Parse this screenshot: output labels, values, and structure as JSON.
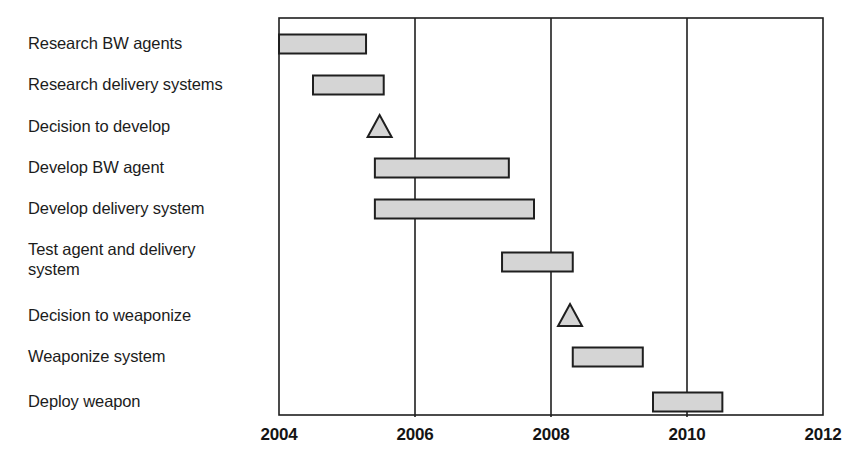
{
  "chart_data": {
    "type": "bar",
    "chart_subtype": "gantt",
    "title": "",
    "xlabel": "",
    "ylabel": "",
    "xlim": [
      2004,
      2012
    ],
    "xticks": [
      2004,
      2006,
      2008,
      2010,
      2012
    ],
    "xtick_labels": [
      "2004",
      "2006",
      "2008",
      "2010",
      "2012"
    ],
    "gridlines": [
      2006,
      2008,
      2010
    ],
    "grid": true,
    "legend": "none",
    "bar_fill": "#d5d5d5",
    "bar_stroke": "#1f1f1f",
    "axis_color": "#1f1f1f",
    "categories": [
      "Research BW agents",
      "Research delivery systems",
      "Decision to develop",
      "Develop BW agent",
      "Develop delivery system",
      "Test agent and delivery\nsystem",
      "Decision to weaponize",
      "Weaponize system",
      "Deploy weapon"
    ],
    "tasks": [
      {
        "name": "Research BW agents",
        "marker": "bar",
        "start": 2004.0,
        "end": 2005.28
      },
      {
        "name": "Research delivery systems",
        "marker": "bar",
        "start": 2004.5,
        "end": 2005.54
      },
      {
        "name": "Decision to develop",
        "marker": "milestone",
        "at": 2005.48
      },
      {
        "name": "Develop BW agent",
        "marker": "bar",
        "start": 2005.41,
        "end": 2007.38
      },
      {
        "name": "Develop delivery system",
        "marker": "bar",
        "start": 2005.41,
        "end": 2007.75
      },
      {
        "name": "Test agent and delivery system",
        "marker": "bar",
        "start": 2007.28,
        "end": 2008.32
      },
      {
        "name": "Decision to weaponize",
        "marker": "milestone",
        "at": 2008.28
      },
      {
        "name": "Weaponize system",
        "marker": "bar",
        "start": 2008.32,
        "end": 2009.35
      },
      {
        "name": "Deploy weapon",
        "marker": "bar",
        "start": 2009.5,
        "end": 2010.52
      }
    ]
  }
}
